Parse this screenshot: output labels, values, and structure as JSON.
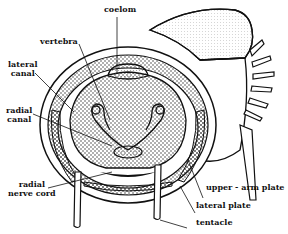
{
  "figure": {
    "ink_color": "#111111",
    "background": "#ffffff"
  },
  "labels": {
    "coelom": "coelom",
    "vertebra": "vertebra",
    "lateral_canal_1": "lateral",
    "lateral_canal_2": "canal",
    "radial_canal_1": "radial",
    "radial_canal_2": "canal",
    "radial_nerve_cord_1": "radial",
    "radial_nerve_cord_2": "nerve cord",
    "upper_arm_plate": "upper - arm plate",
    "lateral_plate": "lateral plate",
    "tentacle": "tentacle"
  }
}
